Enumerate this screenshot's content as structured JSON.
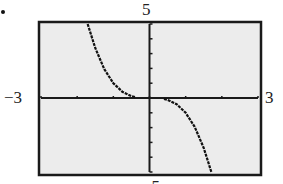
{
  "labels": {
    "ymax": "5",
    "ymin": "−5",
    "xmin": "−3",
    "xmax": "3"
  },
  "colors": {
    "plot_background": "#ececec",
    "frame": "#1a1a1a",
    "curve": "#111111"
  },
  "chart_data": {
    "type": "line",
    "title": "",
    "xlabel": "",
    "ylabel": "",
    "xlim": [
      -3,
      3
    ],
    "ylim": [
      -5,
      5
    ],
    "xticks": [
      -3,
      -2,
      -1,
      0,
      1,
      2,
      3
    ],
    "yticks": [
      -5,
      -4,
      -3,
      -2,
      -1,
      0,
      1,
      2,
      3,
      4,
      5
    ],
    "grid": false,
    "legend": null,
    "annotations": [
      "Window labels: x from −3 to 3, y from −5 to 5 (graphing calculator view)"
    ],
    "series": [
      {
        "name": "curve (decreasing, odd-symmetric, e.g. y = -x^3)",
        "x": [
          -1.71,
          -1.5,
          -1.25,
          -1.0,
          -0.75,
          -0.5,
          -0.4,
          0.4,
          0.5,
          0.75,
          1.0,
          1.25,
          1.5,
          1.71
        ],
        "y": [
          5.0,
          3.38,
          1.95,
          1.0,
          0.42,
          0.13,
          0.06,
          -0.06,
          -0.13,
          -0.42,
          -1.0,
          -1.95,
          -3.38,
          -5.0
        ]
      }
    ]
  }
}
